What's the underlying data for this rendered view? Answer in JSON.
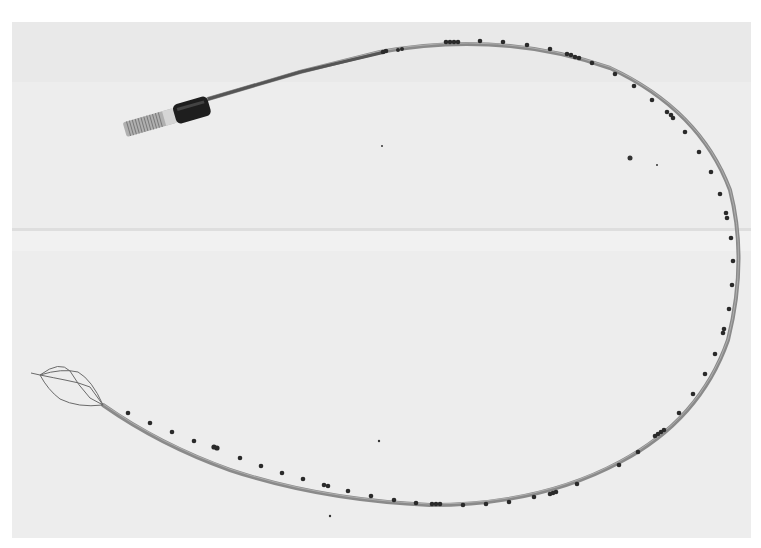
{
  "image": {
    "type": "photograph",
    "mode": "grayscale",
    "width": 761,
    "height": 548,
    "subject": "catheter with basket tip",
    "colors": {
      "margin": "#ffffff",
      "background": "#ededed",
      "background_seam": "#d9d9d9",
      "tube": "#8a8a8a",
      "tube_highlight": "#bdbdbd",
      "marker_band": "#2a2a2a",
      "connector_collar": "#1e1e1e",
      "connector_thread": "#a0a0a0",
      "basket_wire": "#6a6a6a"
    },
    "components": {
      "connector": {
        "position": [
          125,
          90
        ],
        "description": "threaded connector with dark collar"
      },
      "proximal_shaft": {
        "from": [
          210,
          98
        ],
        "to": [
          420,
          45
        ]
      },
      "catheter_loop": {
        "apex": [
          500,
          43
        ],
        "rightmost": [
          738,
          260
        ],
        "bottom": [
          470,
          505
        ]
      },
      "basket_tip": {
        "position": [
          30,
          385
        ],
        "description": "wire basket, 4 struts"
      }
    }
  }
}
